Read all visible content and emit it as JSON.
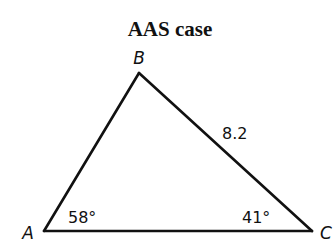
{
  "title": "AAS case",
  "vertices": {
    "A": {
      "label": "A"
    },
    "B": {
      "label": "B"
    },
    "C": {
      "label": "C"
    }
  },
  "angles": {
    "A": "58°",
    "C": "41°"
  },
  "sides": {
    "BC": "8.2"
  },
  "colors": {
    "stroke": "#111111",
    "background": "#ffffff"
  }
}
